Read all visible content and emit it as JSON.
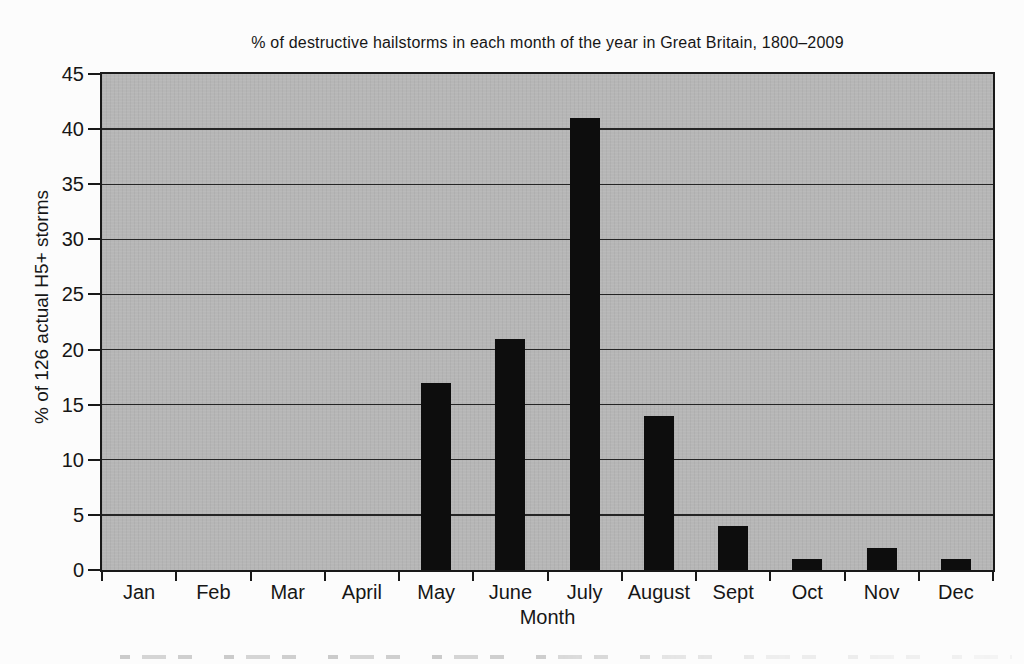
{
  "chart_data": {
    "type": "bar",
    "title": "% of destructive hailstorms in each month of the year in Great Britain, 1800–2009",
    "xlabel": "Month",
    "ylabel": "% of 126 actual H5+ storms",
    "categories": [
      "Jan",
      "Feb",
      "Mar",
      "April",
      "May",
      "June",
      "July",
      "August",
      "Sept",
      "Oct",
      "Nov",
      "Dec"
    ],
    "values": [
      0,
      0,
      0,
      0,
      17,
      21,
      41,
      14,
      4,
      1,
      2,
      1
    ],
    "ylim": [
      0,
      45
    ],
    "yticks": [
      0,
      5,
      10,
      15,
      20,
      25,
      30,
      35,
      40,
      45
    ],
    "grid": "horizontal",
    "legend": "none",
    "colors": {
      "bar": "#0d0d0d",
      "plot_background": "#b6b6b6",
      "page_background": "#fcfcfc",
      "axis_and_text": "#191919"
    }
  }
}
